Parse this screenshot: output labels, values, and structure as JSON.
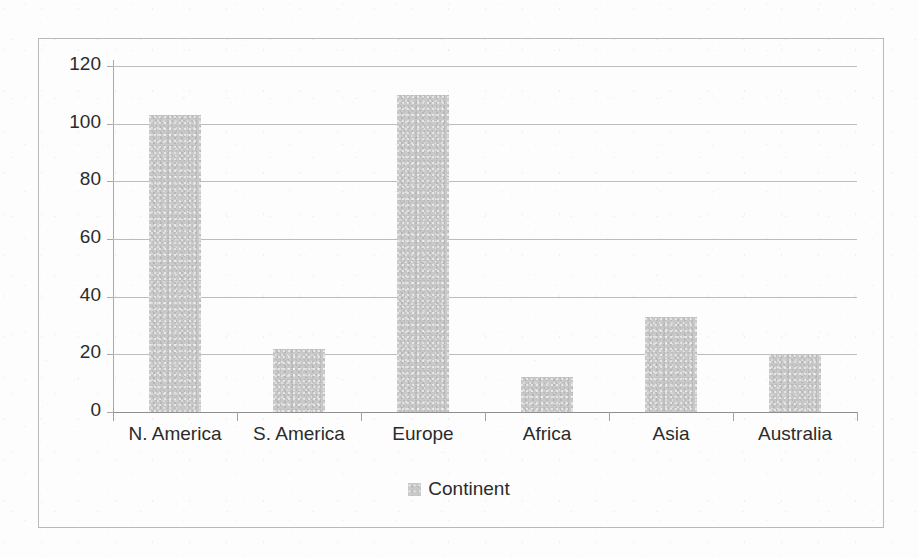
{
  "chart_data": {
    "type": "bar",
    "title": "",
    "xlabel": "",
    "ylabel": "",
    "categories": [
      "N. America",
      "S. America",
      "Europe",
      "Africa",
      "Asia",
      "Australia"
    ],
    "values": [
      103,
      22,
      110,
      12,
      33,
      20
    ],
    "series": [
      {
        "name": "Continent",
        "values": [
          103,
          22,
          110,
          12,
          33,
          20
        ]
      }
    ],
    "ylim": [
      0,
      120
    ],
    "y_ticks": [
      0,
      20,
      40,
      60,
      80,
      100,
      120
    ],
    "y_tick_labels": [
      "0",
      "20",
      "40",
      "60",
      "80",
      "100",
      "120"
    ],
    "grid": true,
    "legend_position": "bottom",
    "bar_color": "#c9c9c9",
    "axis_color": "#a9a9a9",
    "grid_color": "#bcbcbc",
    "text_color": "#2b2b2b"
  },
  "legend": {
    "entries": [
      {
        "label": "Continent",
        "color": "#c9c9c9"
      }
    ]
  }
}
